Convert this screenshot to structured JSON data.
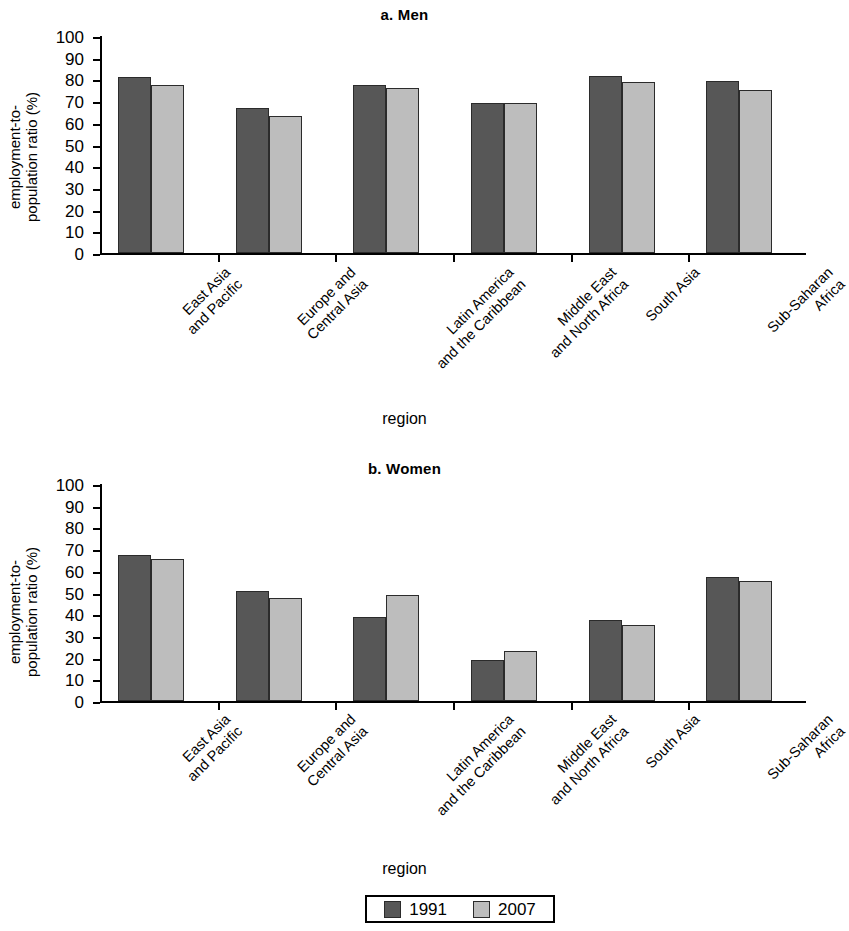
{
  "figure": {
    "axis_title": "region",
    "ylabel_line1": "employment-to-",
    "ylabel_line2": "population ratio (%)"
  },
  "legend": {
    "position": "bottom-center",
    "items": [
      {
        "label": "1991",
        "color": "#575757"
      },
      {
        "label": "2007",
        "color": "#bdbdbd"
      }
    ]
  },
  "chart_data": [
    {
      "type": "bar",
      "title": "a. Men",
      "xlabel": "region",
      "ylabel": "employment-to-population ratio (%)",
      "ylim": [
        0,
        100
      ],
      "yticks": [
        0,
        10,
        20,
        30,
        40,
        50,
        60,
        70,
        80,
        90,
        100
      ],
      "grid": false,
      "legend_position": "bottom-center",
      "categories": [
        "East Asia\nand Pacific",
        "Europe and\nCentral Asia",
        "Latin America\nand the Caribbean",
        "Middle East\nand North Africa",
        "South Asia",
        "Sub-Saharan\nAfrica"
      ],
      "series": [
        {
          "name": "1991",
          "color": "#575757",
          "values": [
            81,
            67,
            77.5,
            69,
            81.5,
            79.5
          ]
        },
        {
          "name": "2007",
          "color": "#bdbdbd",
          "values": [
            77.5,
            63,
            76,
            69,
            79,
            75
          ]
        }
      ]
    },
    {
      "type": "bar",
      "title": "b. Women",
      "xlabel": "region",
      "ylabel": "employment-to-population ratio (%)",
      "ylim": [
        0,
        100
      ],
      "yticks": [
        0,
        10,
        20,
        30,
        40,
        50,
        60,
        70,
        80,
        90,
        100
      ],
      "grid": false,
      "legend_position": "bottom-center",
      "categories": [
        "East Asia\nand Pacific",
        "Europe and\nCentral Asia",
        "Latin America\nand the Caribbean",
        "Middle East\nand North Africa",
        "South Asia",
        "Sub-Saharan\nAfrica"
      ],
      "series": [
        {
          "name": "1991",
          "color": "#575757",
          "values": [
            67.5,
            50.5,
            38.5,
            19,
            37.5,
            57
          ]
        },
        {
          "name": "2007",
          "color": "#bdbdbd",
          "values": [
            65.5,
            47.5,
            49,
            23,
            35,
            55.5
          ]
        }
      ]
    }
  ]
}
